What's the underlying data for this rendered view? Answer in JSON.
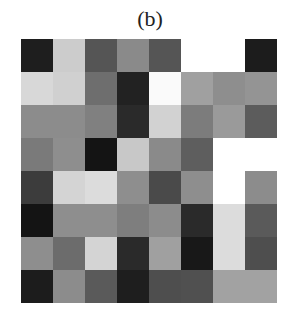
{
  "chart_data": {
    "type": "heatmap",
    "title": "(b)",
    "xlabel": "",
    "ylabel": "",
    "rows": 8,
    "cols": 8,
    "colormap": "grayscale",
    "grid": false,
    "legend": null,
    "values": [
      [
        "#1e1e1e",
        "#cccccc",
        "#555555",
        "#8a8a8a",
        "#555555",
        "#ffffff",
        "#ffffff",
        "#1c1c1c"
      ],
      [
        "#d8d8d8",
        "#d0d0d0",
        "#6e6e6e",
        "#222222",
        "#fafafa",
        "#a0a0a0",
        "#8e8e8e",
        "#949494"
      ],
      [
        "#8c8c8c",
        "#8c8c8c",
        "#808080",
        "#2a2a2a",
        "#d2d2d2",
        "#7c7c7c",
        "#9a9a9a",
        "#5c5c5c"
      ],
      [
        "#7a7a7a",
        "#8e8e8e",
        "#141414",
        "#c8c8c8",
        "#8a8a8a",
        "#5e5e5e",
        "#ffffff",
        "#ffffff"
      ],
      [
        "#3c3c3c",
        "#d4d4d4",
        "#dcdcdc",
        "#8e8e8e",
        "#4a4a4a",
        "#8e8e8e",
        "#ffffff",
        "#8c8c8c"
      ],
      [
        "#141414",
        "#8e8e8e",
        "#8e8e8e",
        "#7e7e7e",
        "#8c8c8c",
        "#2a2a2a",
        "#dcdcdc",
        "#5a5a5a"
      ],
      [
        "#8e8e8e",
        "#6c6c6c",
        "#d4d4d4",
        "#2a2a2a",
        "#a0a0a0",
        "#181818",
        "#dcdcdc",
        "#4e4e4e"
      ],
      [
        "#1c1c1c",
        "#8c8c8c",
        "#5a5a5a",
        "#1e1e1e",
        "#4e4e4e",
        "#505050",
        "#a2a2a2",
        "#a2a2a2"
      ]
    ],
    "intensity_0_255": [
      [
        30,
        204,
        85,
        138,
        85,
        255,
        255,
        28
      ],
      [
        216,
        208,
        110,
        34,
        250,
        160,
        142,
        148
      ],
      [
        140,
        140,
        128,
        42,
        210,
        124,
        154,
        92
      ],
      [
        122,
        142,
        20,
        200,
        138,
        94,
        255,
        255
      ],
      [
        60,
        212,
        220,
        142,
        74,
        142,
        255,
        140
      ],
      [
        20,
        142,
        142,
        126,
        140,
        42,
        220,
        90
      ],
      [
        142,
        108,
        212,
        42,
        160,
        24,
        220,
        78
      ],
      [
        28,
        140,
        90,
        30,
        78,
        80,
        162,
        162
      ]
    ]
  }
}
